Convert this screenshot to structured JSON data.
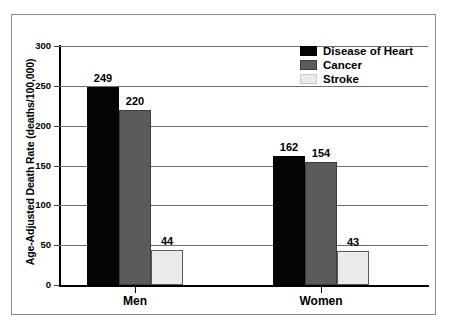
{
  "chart_data": {
    "type": "bar",
    "title": "",
    "xlabel": "",
    "ylabel": "Age-Adjusted Death Rate (deaths/100,000)",
    "categories": [
      "Men",
      "Women"
    ],
    "series": [
      {
        "name": "Disease of Heart",
        "color": "#050505",
        "values": [
          249,
          162
        ]
      },
      {
        "name": "Cancer",
        "color": "#5b5b5b",
        "values": [
          220,
          154
        ]
      },
      {
        "name": "Stroke",
        "color": "#ebebeb",
        "values": [
          44,
          43
        ]
      }
    ],
    "ylim": [
      0,
      300
    ],
    "yticks": [
      0,
      50,
      100,
      150,
      200,
      250,
      300
    ],
    "ytick_labels": [
      "0",
      "50",
      "100",
      "150",
      "200",
      "250",
      "300"
    ],
    "grid": true,
    "legend_position": "top-right",
    "data_labels": [
      "249",
      "220",
      "44",
      "162",
      "154",
      "43"
    ]
  },
  "legend": {
    "items": [
      {
        "label": "Disease of Heart",
        "swatch": "heart"
      },
      {
        "label": "Cancer",
        "swatch": "cancer"
      },
      {
        "label": "Stroke",
        "swatch": "stroke"
      }
    ]
  }
}
